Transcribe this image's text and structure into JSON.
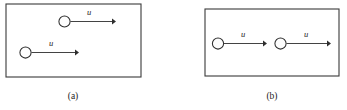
{
  "figure": {
    "type": "physics-diagram",
    "background_color": "#ffffff",
    "line_color": "#2e2e2e",
    "border_color": "#3a3a3a",
    "panels": [
      {
        "id": "panel-a",
        "caption": "(a)",
        "caption_x": 73,
        "caption_y": 99,
        "border": {
          "x": 6,
          "y": 4,
          "width": 135,
          "height": 73
        },
        "particles": [
          {
            "id": "particle-a-top",
            "cx": 64.5,
            "cy": 21.5,
            "r": 5.6,
            "arrow": {
              "x1": 70.5,
              "y1": 21.5,
              "x2": 116,
              "y2": 21.5,
              "label": "u",
              "label_x": 89,
              "label_y": 15
            }
          },
          {
            "id": "particle-a-bottom",
            "cx": 25.5,
            "cy": 52.5,
            "r": 5.6,
            "arrow": {
              "x1": 31.5,
              "y1": 52.5,
              "x2": 79,
              "y2": 52.5,
              "label": "u",
              "label_x": 51,
              "label_y": 46
            }
          }
        ]
      },
      {
        "id": "panel-b",
        "caption": "(b)",
        "caption_x": 272,
        "caption_y": 99,
        "border": {
          "x": 205,
          "y": 9,
          "width": 134,
          "height": 67
        },
        "particles": [
          {
            "id": "particle-b-left",
            "cx": 218,
            "cy": 43.5,
            "r": 5.6,
            "arrow": {
              "x1": 224,
              "y1": 43.5,
              "x2": 267,
              "y2": 43.5,
              "label": "u",
              "label_x": 243,
              "label_y": 37
            }
          },
          {
            "id": "particle-b-right",
            "cx": 280.5,
            "cy": 43.5,
            "r": 5.6,
            "arrow": {
              "x1": 286.5,
              "y1": 43.5,
              "x2": 331,
              "y2": 43.5,
              "label": "u",
              "label_x": 306,
              "label_y": 37
            }
          }
        ]
      }
    ]
  }
}
